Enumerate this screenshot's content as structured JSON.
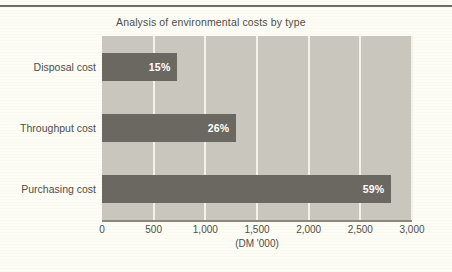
{
  "chart_data": {
    "type": "bar",
    "orientation": "horizontal",
    "title": "Analysis of environmental costs by type",
    "xlabel": "(DM '000)",
    "ylabel": "",
    "categories": [
      "Disposal cost",
      "Throughput cost",
      "Purchasing cost"
    ],
    "values": [
      730,
      1300,
      2800
    ],
    "data_labels": [
      "15%",
      "26%",
      "59%"
    ],
    "xlim": [
      0,
      3000
    ],
    "xticks": [
      0,
      500,
      1000,
      1500,
      2000,
      2500,
      3000
    ],
    "xtick_labels": [
      "0",
      "500",
      "1,000",
      "1,500",
      "2,000",
      "2,500",
      "3,000"
    ],
    "grid": true,
    "grid_axis": "x",
    "legend": false,
    "colors": {
      "bar": "#6b6862",
      "plot_background": "#c9c7bd",
      "gridline": "#f2f1ea",
      "page_background": "#fdfdf6",
      "text": "#4e4d48",
      "data_label": "#ffffff",
      "axis_line": "#8a877c",
      "top_rule": "#6e6b5f"
    }
  }
}
